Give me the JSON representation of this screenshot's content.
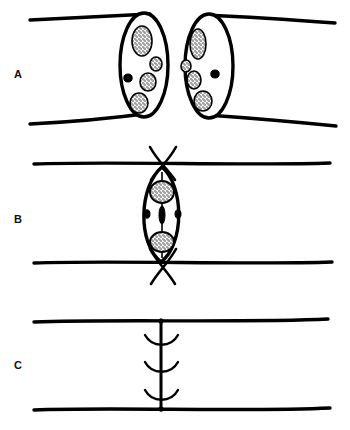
{
  "figure": {
    "width": 350,
    "height": 430,
    "background_color": "#ffffff",
    "ink_color": "#000000",
    "stipple_color": "#1a1a1a"
  },
  "panels": [
    {
      "id": "A",
      "label": "A",
      "caption": "Two separated cylindrical cell ends shown in oblique view, each sealed by an elliptical end face containing five stippled organelles",
      "label_x": 14,
      "label_y": 69,
      "elements": {
        "left_cylinder": {
          "name": "left-cell-cylinder",
          "top_line": "M 30 20 L 150 14",
          "bottom_line": "M 30 124 L 152 113",
          "end_face_ellipse": {
            "cx": 144,
            "cy": 65,
            "rx": 24,
            "ry": 52
          }
        },
        "right_cylinder": {
          "name": "right-cell-cylinder",
          "top_line": "M 205 15 L 335 23",
          "bottom_line": "M 207 115 L 336 126",
          "end_face_ellipse": {
            "cx": 209,
            "cy": 66,
            "rx": 24,
            "ry": 52
          }
        },
        "left_organelles": [
          {
            "cx": 142,
            "cy": 41,
            "rx": 10,
            "ry": 15,
            "fill": "stipple"
          },
          {
            "cx": 155,
            "cy": 64,
            "rx": 6,
            "ry": 7,
            "fill": "stipple"
          },
          {
            "cx": 129,
            "cy": 78,
            "rx": 4,
            "ry": 4,
            "fill": "solid"
          },
          {
            "cx": 148,
            "cy": 81,
            "rx": 8,
            "ry": 9,
            "fill": "stipple"
          },
          {
            "cx": 139,
            "cy": 103,
            "rx": 9,
            "ry": 10,
            "fill": "stipple"
          }
        ],
        "right_organelles": [
          {
            "cx": 198,
            "cy": 44,
            "rx": 8,
            "ry": 15,
            "fill": "stipple"
          },
          {
            "cx": 186,
            "cy": 66,
            "rx": 5,
            "ry": 6,
            "fill": "stipple"
          },
          {
            "cx": 214,
            "cy": 74,
            "rx": 4,
            "ry": 4,
            "fill": "solid"
          },
          {
            "cx": 194,
            "cy": 79,
            "rx": 7,
            "ry": 9,
            "fill": "stipple"
          },
          {
            "cx": 203,
            "cy": 101,
            "rx": 9,
            "ry": 10,
            "fill": "stipple"
          }
        ]
      }
    },
    {
      "id": "B",
      "label": "B",
      "caption": "Fused fusiform (lens-shaped) junction spanning the two cell walls, containing two stippled nuclei joined by a central thread with a dark midbody, flanked by two small vesicles; crossed fibres emerge above and below",
      "label_x": 14,
      "label_y": 214,
      "elements": {
        "wall_top_line": "M 34 164 L 330 163",
        "wall_bottom_line": "M 34 263 L 332 262",
        "lens_outline": "M 162 168 C 140 185, 138 245, 161 261 C 184 245, 183 185, 162 168 Z",
        "cross_top": [
          "M 150 148 L 174 178",
          "M 175 148 L 150 178"
        ],
        "cross_bottom": [
          "M 150 251 L 174 282",
          "M 175 251 L 150 282"
        ],
        "spindle_thread": "M 162 170 L 162 259",
        "midbody": {
          "cx": 162,
          "cy": 215,
          "rx": 3,
          "ry": 9
        },
        "nuclei": [
          {
            "cx": 162,
            "cy": 192,
            "rx": 12,
            "ry": 11,
            "fill": "stipple"
          },
          {
            "cx": 162,
            "cy": 242,
            "rx": 12,
            "ry": 10,
            "fill": "stipple"
          }
        ],
        "vesicles": [
          {
            "cx": 148,
            "cy": 214,
            "rx": 3,
            "ry": 4,
            "fill": "solid"
          },
          {
            "cx": 177,
            "cy": 214,
            "rx": 3,
            "ry": 4,
            "fill": "solid"
          }
        ]
      }
    },
    {
      "id": "C",
      "label": "C",
      "caption": "Completed transverse septum drawn as a single vertical line between the two walls, bearing three small paired arc marks",
      "label_x": 14,
      "label_y": 360,
      "elements": {
        "wall_top_line": "M 34 322 L 328 319",
        "wall_bottom_line": "M 34 410 L 330 408",
        "septum_line": "M 161 321 L 161 409",
        "arc_marks": [
          {
            "cy": 341,
            "arc": "M 146 336 C 153 347, 170 347, 177 336"
          },
          {
            "cy": 368,
            "arc": "M 146 363 C 153 374, 170 374, 177 363"
          },
          {
            "cy": 396,
            "arc": "M 146 391 C 153 402, 170 402, 177 391"
          }
        ],
        "junction_dots": [
          {
            "cx": 161,
            "cy": 321,
            "r": 2.5
          },
          {
            "cx": 161,
            "cy": 409,
            "r": 2.5
          }
        ]
      }
    }
  ]
}
